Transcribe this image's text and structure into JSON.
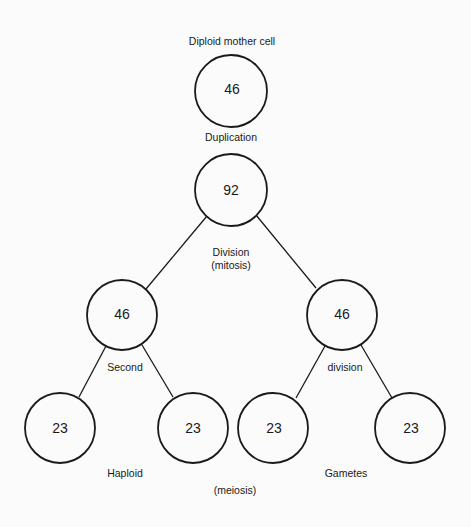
{
  "diagram": {
    "type": "tree",
    "background": "#fbfbfb",
    "stroke": "#1a1a1a",
    "nodes": [
      {
        "id": "mother",
        "value": "46",
        "cx": 231,
        "cy": 91,
        "r": 36
      },
      {
        "id": "duplicated",
        "value": "92",
        "cx": 231,
        "cy": 190,
        "r": 36
      },
      {
        "id": "left46",
        "value": "46",
        "cx": 122,
        "cy": 315,
        "r": 35
      },
      {
        "id": "right46",
        "value": "46",
        "cx": 342,
        "cy": 315,
        "r": 35
      },
      {
        "id": "gamete1",
        "value": "23",
        "cx": 60,
        "cy": 428,
        "r": 35
      },
      {
        "id": "gamete2",
        "value": "23",
        "cx": 193,
        "cy": 428,
        "r": 35
      },
      {
        "id": "gamete3",
        "value": "23",
        "cx": 273,
        "cy": 428,
        "r": 35
      },
      {
        "id": "gamete4",
        "value": "23",
        "cx": 410,
        "cy": 428,
        "r": 35
      }
    ],
    "edges": [
      {
        "from": "duplicated",
        "to": "left46"
      },
      {
        "from": "duplicated",
        "to": "right46"
      },
      {
        "from": "left46",
        "to": "gamete1"
      },
      {
        "from": "left46",
        "to": "gamete2"
      },
      {
        "from": "right46",
        "to": "gamete3"
      },
      {
        "from": "right46",
        "to": "gamete4"
      }
    ],
    "labels": {
      "mother_cell": "Diploid mother cell",
      "duplication": "Duplication",
      "division_line1": "Division",
      "division_line2": "(mitosis)",
      "second": "Second",
      "division": "division",
      "haploid": "Haploid",
      "gametes": "Gametes",
      "meiosis": "(meiosis)"
    }
  }
}
